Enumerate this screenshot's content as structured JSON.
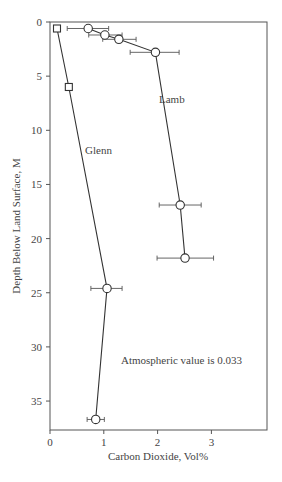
{
  "chart_data": {
    "type": "line",
    "title": "",
    "xlabel": "Carbon Dioxide, Vol%",
    "ylabel": "Depth Below Land Surface, M",
    "xlim": [
      0,
      4
    ],
    "ylim": [
      0,
      38
    ],
    "y_inverted": true,
    "grid": false,
    "x_ticks": [
      0,
      1,
      2,
      3
    ],
    "y_ticks": [
      0,
      5,
      10,
      15,
      20,
      25,
      30,
      35
    ],
    "series": [
      {
        "name": "Lamb",
        "marker": "circle",
        "points": [
          {
            "x": 0.71,
            "y": 0.6,
            "xerr_low": 0.32,
            "xerr_high": 1.09
          },
          {
            "x": 1.02,
            "y": 1.2,
            "xerr_low": 0.72,
            "xerr_high": 1.34
          },
          {
            "x": 1.28,
            "y": 1.6,
            "xerr_low": 0.98,
            "xerr_high": 1.6
          },
          {
            "x": 1.96,
            "y": 2.8,
            "xerr_low": 1.49,
            "xerr_high": 2.4
          },
          {
            "x": 2.42,
            "y": 16.9,
            "xerr_low": 2.03,
            "xerr_high": 2.81
          },
          {
            "x": 2.51,
            "y": 21.8,
            "xerr_low": 1.99,
            "xerr_high": 3.04
          }
        ]
      },
      {
        "name": "Glenn",
        "marker": "square-then-circle",
        "points": [
          {
            "x": 0.13,
            "y": 0.6,
            "marker": "square"
          },
          {
            "x": 0.35,
            "y": 6.0,
            "marker": "square"
          },
          {
            "x": 1.06,
            "y": 24.6,
            "xerr_low": 0.76,
            "xerr_high": 1.34,
            "marker": "circle"
          },
          {
            "x": 0.85,
            "y": 36.7,
            "xerr_low": 0.69,
            "xerr_high": 1.01,
            "marker": "circle"
          }
        ]
      }
    ],
    "annotations": [
      {
        "text": "Atmospheric value is 0.033",
        "x": 1.3,
        "y": 31
      }
    ]
  },
  "labels": {
    "x_axis": "Carbon Dioxide, Vol%",
    "y_axis": "Depth Below Land Surface, M",
    "lamb": "Lamb",
    "glenn": "Glenn",
    "annotation": "Atmospheric value is 0.033",
    "x_ticks": [
      "0",
      "1",
      "2",
      "3"
    ],
    "y_ticks": [
      "0",
      "5",
      "10",
      "15",
      "20",
      "25",
      "30",
      "35"
    ]
  }
}
